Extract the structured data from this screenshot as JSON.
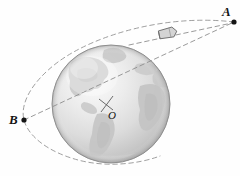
{
  "figure": {
    "background_color": "#fefefe",
    "width": 240,
    "height": 176
  },
  "labels": {
    "point_a": "A",
    "point_b": "B",
    "center_o": "O"
  },
  "colors": {
    "ocean_light": "#f2f2f2",
    "ocean_mid": "#d8d8d8",
    "ocean_dark": "#b9b9b9",
    "land": "#c9c9c9",
    "land_dark": "#bdbdbd",
    "outline": "#8a8a8a",
    "dash": "#8f8f8f",
    "marker": "#1a1a1a",
    "craft_body": "#d2d2d2",
    "craft_outline": "#7a7a7a"
  },
  "elements": {
    "globe": "earth-sphere",
    "orbit": "dashed-elliptical-orbit",
    "apogee_line": "dashed-line-o-to-a",
    "tangent_line": "dashed-line-upper-to-a",
    "spacecraft": "spacecraft-icon",
    "center_marker": "center-cross-marker",
    "point_a_marker": "point-a-dot",
    "point_b_marker": "point-b-dot"
  },
  "geometry": {
    "globe_center": [
      111,
      104
    ],
    "globe_radius": 59,
    "point_a": [
      234,
      22
    ],
    "point_b": [
      24,
      120
    ],
    "spacecraft": [
      168,
      33
    ]
  }
}
